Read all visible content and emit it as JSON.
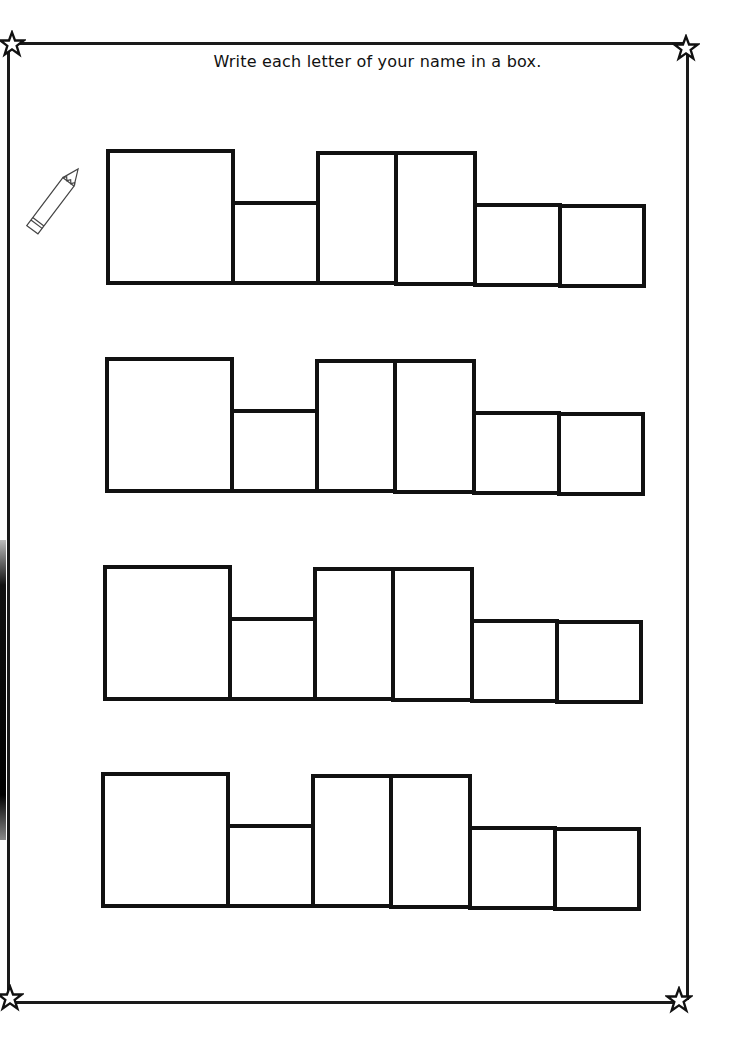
{
  "worksheet": {
    "instruction": "Write each letter of your name in a box.",
    "decorations": {
      "corner_icon": "star-outline-icon",
      "side_icon": "pencil-icon"
    },
    "colors": {
      "ink": "#111111",
      "paper": "#ffffff"
    },
    "rows": [
      {
        "boxes": 6
      },
      {
        "boxes": 6
      },
      {
        "boxes": 6
      },
      {
        "boxes": 6
      }
    ],
    "box_pattern": [
      "tall-wide",
      "short",
      "tall",
      "tall",
      "short",
      "short"
    ]
  }
}
